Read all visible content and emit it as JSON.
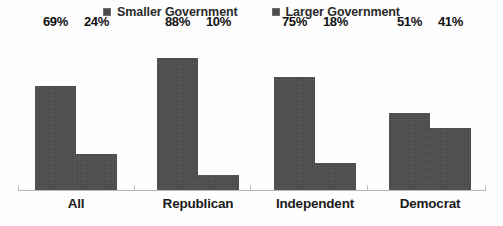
{
  "chart_data": {
    "type": "bar",
    "title": "",
    "subtitle": "",
    "xlabel": "",
    "ylabel": "",
    "ylim": [
      0,
      100
    ],
    "grid": false,
    "legend_position": "top-center",
    "categories": [
      "All",
      "Republican",
      "Independent",
      "Democrat"
    ],
    "series": [
      {
        "name": "Smaller Government",
        "color": "#4d4d4d",
        "values": [
          69,
          88,
          75,
          51
        ],
        "labels": [
          "69%",
          "88%",
          "75%",
          "51%"
        ]
      },
      {
        "name": "Larger Government",
        "color": "#4d4d4d",
        "values": [
          24,
          10,
          18,
          41
        ],
        "labels": [
          "24%",
          "10%",
          "18%",
          "41%"
        ]
      }
    ]
  },
  "legend": {
    "entries": [
      {
        "label": "Smaller Government",
        "swatch_name": "legend-swatch-smaller-government"
      },
      {
        "label": "Larger Government",
        "swatch_name": "legend-swatch-larger-government"
      }
    ]
  },
  "axis": {
    "baseline_color": "#b6b6b6",
    "tick_color": "#bdbdbd"
  }
}
